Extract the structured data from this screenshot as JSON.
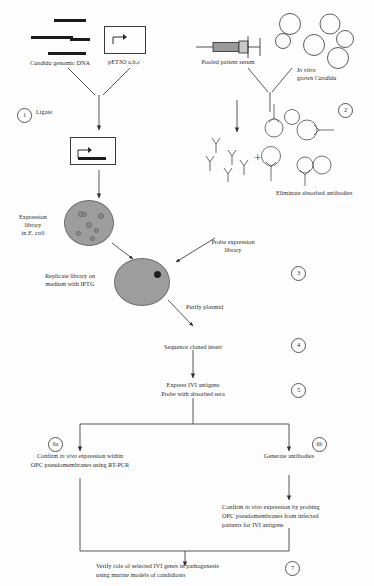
{
  "diagram": {
    "labels": {
      "genomic_dna": "Candida genomic DNA",
      "genomic_dna_italic": "Candida",
      "genomic_dna_rest": " genomic DNA",
      "plasmid": "pET3O a,b,c",
      "pooled_serum": "Pooled patient serum",
      "invitro_line1": "In vitro",
      "invitro_line2": "grown Candida",
      "ligate": "Ligate",
      "eliminate": "Eliminate absorbed antibodies",
      "expression_library_1": "Expression",
      "expression_library_2": "library",
      "expression_library_3": "in E. coli",
      "expression_library_3_italic": "E. coli",
      "replicate_1": "Replicate library on",
      "replicate_2": "medium with IPTG",
      "probe_1": "Probe expression",
      "probe_2": "library",
      "purify": "Purify plasmid",
      "sequence": "Sequence cloned insert",
      "express_1": "Express IVI antigens",
      "express_2": "Probe with absorbed sera",
      "confirm_rtpcr_1": "Confirm in vivo expression within",
      "confirm_rtpcr_1a": "Confirm ",
      "confirm_rtpcr_1b": "in vivo",
      "confirm_rtpcr_1c": " expression within",
      "confirm_rtpcr_2": "OPC pseudomembranes using RT-PCR",
      "generate_antibodies": "Generate antibodies",
      "confirm_probe_1a": "Confirm ",
      "confirm_probe_1b": "in vivo",
      "confirm_probe_1c": " expression by probing",
      "confirm_probe_2": "OPC pseudomembranes from infected",
      "confirm_probe_3": "patients for IVI antigens",
      "verify_1": "Verify role of selected IVI genes in pathogenesis",
      "verify_2": "using murine models of candidiasis",
      "plus": "+"
    },
    "steps": [
      {
        "id": "1",
        "label": "1"
      },
      {
        "id": "2",
        "label": "2"
      },
      {
        "id": "3",
        "label": "3"
      },
      {
        "id": "4",
        "label": "4"
      },
      {
        "id": "5",
        "label": "5"
      },
      {
        "id": "6a",
        "label": "6a"
      },
      {
        "id": "6b",
        "label": "6b"
      },
      {
        "id": "7",
        "label": "7"
      }
    ],
    "colors": {
      "ink": "#2a2a2a",
      "line": "#3a3a3a",
      "plate_fill": "#9d9d9d",
      "fragment": "#1b1b1b"
    }
  }
}
